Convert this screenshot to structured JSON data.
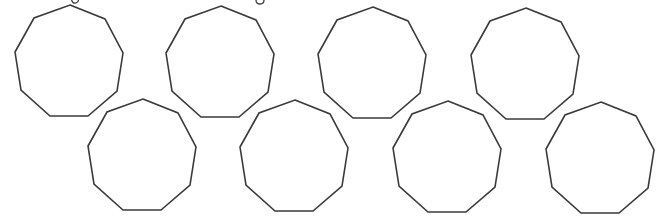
{
  "figure": {
    "shape_type": "nonagon",
    "sides": 9,
    "stroke_color": "#3a3a3a",
    "fill_color": "#ffffff",
    "background": "#ffffff",
    "vertex_offsets_from_top": [
      [
        0,
        0
      ],
      [
        35,
        14
      ],
      [
        53,
        48
      ],
      [
        47,
        86
      ],
      [
        18,
        111
      ],
      [
        -20,
        111
      ],
      [
        -49,
        85
      ],
      [
        -55,
        47
      ],
      [
        -36,
        13
      ]
    ],
    "rows": [
      {
        "name": "top-row",
        "shapes": [
          {
            "id": "nonagon-1",
            "top": [
              70,
              5
            ]
          },
          {
            "id": "nonagon-2",
            "top": [
              221,
              6
            ]
          },
          {
            "id": "nonagon-3",
            "top": [
              373,
              7
            ]
          },
          {
            "id": "nonagon-4",
            "top": [
              526,
              8
            ]
          }
        ]
      },
      {
        "name": "bottom-row",
        "shapes": [
          {
            "id": "nonagon-5",
            "top": [
              143,
              99
            ]
          },
          {
            "id": "nonagon-6",
            "top": [
              295,
              100
            ]
          },
          {
            "id": "nonagon-7",
            "top": [
              448,
              101
            ]
          },
          {
            "id": "nonagon-8",
            "top": [
              601,
              102
            ]
          }
        ]
      }
    ]
  }
}
